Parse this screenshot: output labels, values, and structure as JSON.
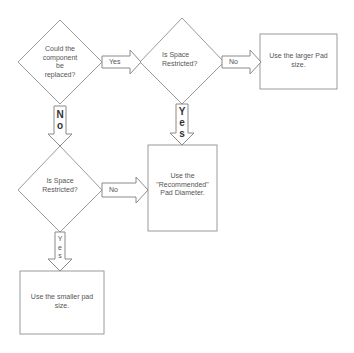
{
  "decisions": [
    {
      "id": "d1",
      "lines": [
        "Could the",
        "component",
        "be",
        "replaced?"
      ]
    },
    {
      "id": "d2",
      "lines": [
        "Is Space",
        "Restricted?"
      ]
    },
    {
      "id": "d3",
      "lines": [
        "Is Space",
        "Restricted?"
      ]
    }
  ],
  "outcomes": [
    {
      "id": "o1",
      "lines": [
        "Use the larger Pad",
        "size."
      ]
    },
    {
      "id": "o2",
      "lines": [
        "Use the",
        "\"Recommended\"",
        "Pad Diameter."
      ]
    },
    {
      "id": "o3",
      "lines": [
        "Use the smaller pad",
        "size."
      ]
    }
  ],
  "arrows": {
    "d1_to_d2": {
      "label": "Yes"
    },
    "d1_to_d3": {
      "label": "No",
      "letters": [
        "N",
        "o"
      ]
    },
    "d2_to_o1": {
      "label": "No"
    },
    "d2_to_o2": {
      "label": "Yes",
      "letters": [
        "Y",
        "e",
        "s"
      ]
    },
    "d3_to_o2": {
      "label": "No"
    },
    "d3_to_o3": {
      "label": "Yes",
      "letters": [
        "Y",
        "e",
        "s"
      ]
    }
  },
  "colors": {
    "stroke": "#9a9a9a",
    "text": "#555555",
    "background": "#ffffff"
  }
}
